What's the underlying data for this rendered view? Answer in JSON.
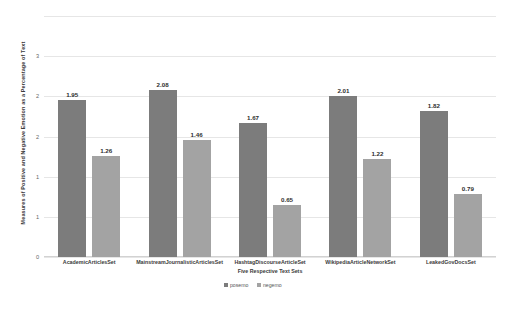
{
  "chart_data": {
    "type": "bar",
    "title": "",
    "xlabel": "Five Respective Text Sets",
    "ylabel": "Measures of Positive and Negative Emotion as a Percentage of Text",
    "categories": [
      "AcademicArticlesSet",
      "MainstreamJournalisticArticlesSet",
      "HashtagDiscourseArticleSet",
      "WikipediaArticleNetworkSet",
      "LeakedGovDocsSet"
    ],
    "series": [
      {
        "name": "posemo",
        "color": "#7c7c7c",
        "values": [
          1.95,
          2.08,
          1.67,
          2.01,
          1.82
        ]
      },
      {
        "name": "negemo",
        "color": "#a3a3a3",
        "values": [
          1.26,
          1.46,
          0.65,
          1.22,
          0.79
        ]
      }
    ],
    "ylim": [
      0,
      3
    ],
    "yticks": [
      0,
      1,
      1,
      2,
      2,
      3
    ],
    "ytick_labels": [
      "0",
      "1",
      "1",
      "2",
      "2",
      "3"
    ],
    "ytick_values": [
      0,
      0.5,
      1.0,
      1.5,
      2.0,
      2.5,
      3.0
    ],
    "grid": true,
    "legend_position": "bottom"
  },
  "legend": {
    "items": [
      {
        "label": "posemo",
        "color": "#7c7c7c"
      },
      {
        "label": "negemo",
        "color": "#a3a3a3"
      }
    ]
  }
}
